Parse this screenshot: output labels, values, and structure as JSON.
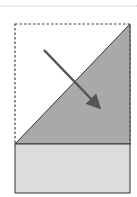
{
  "diagram": {
    "type": "paper-fold",
    "colors": {
      "background": "#ffffff",
      "folded_flap": "#a9a9a9",
      "base_strip": "#dcdcdc",
      "outline": "#333333",
      "arrow": "#555555",
      "dashed_guide": "#444444",
      "top_rule": "#bbbbbb"
    },
    "elements": [
      {
        "name": "top-rule",
        "kind": "dotted-line"
      },
      {
        "name": "original-outline",
        "kind": "dashed-rectangle"
      },
      {
        "name": "folded-flap",
        "kind": "triangle"
      },
      {
        "name": "base-strip",
        "kind": "rectangle"
      },
      {
        "name": "fold-arrow",
        "kind": "arrow",
        "direction": "down-right"
      }
    ]
  }
}
